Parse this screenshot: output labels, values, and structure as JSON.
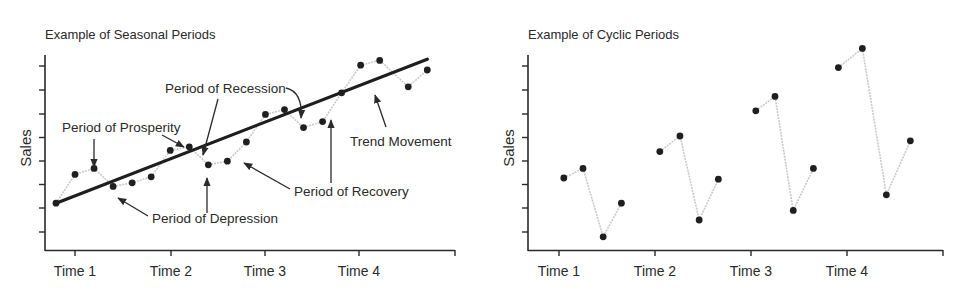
{
  "chart_data": [
    {
      "type": "line",
      "title": "Example of Seasonal Periods",
      "xlabel": "",
      "ylabel": "Sales",
      "categories": [
        "Time 1",
        "Time 2",
        "Time 3",
        "Time 4"
      ],
      "grid": false,
      "y_ticks_count": 8,
      "ylim": [
        0,
        8.5
      ],
      "xlim": [
        0,
        4.3
      ],
      "series": [
        {
          "name": "Sales",
          "x": [
            0.0,
            0.2,
            0.4,
            0.6,
            0.8,
            1.0,
            1.2,
            1.4,
            1.6,
            1.8,
            2.0,
            2.2,
            2.4,
            2.6,
            2.8,
            3.0,
            3.2,
            3.4,
            3.7,
            3.9
          ],
          "values": [
            1.95,
            3.15,
            3.4,
            2.65,
            2.8,
            3.05,
            4.15,
            4.3,
            3.55,
            3.7,
            4.5,
            5.65,
            5.85,
            5.1,
            5.35,
            6.55,
            7.7,
            7.9,
            6.8,
            7.5
          ]
        },
        {
          "name": "Trend Movement",
          "x": [
            0.0,
            3.9
          ],
          "values": [
            1.95,
            7.95
          ]
        }
      ],
      "annotations": [
        "Period of Prosperity",
        "Period of Recession",
        "Period of Depression",
        "Period of Recovery",
        "Trend Movement"
      ]
    },
    {
      "type": "line",
      "title": "Example of Cyclic Periods",
      "xlabel": "",
      "ylabel": "Sales",
      "categories": [
        "Time 1",
        "Time 2",
        "Time 3",
        "Time 4"
      ],
      "grid": false,
      "y_ticks_count": 8,
      "ylim": [
        0,
        8.5
      ],
      "xlim": [
        0,
        4.3
      ],
      "series": [
        {
          "name": "Cycle 1",
          "x": [
            0.05,
            0.25,
            0.46,
            0.65
          ],
          "values": [
            3.0,
            3.4,
            0.55,
            1.95
          ]
        },
        {
          "name": "Cycle 2",
          "x": [
            1.05,
            1.26,
            1.46,
            1.66
          ],
          "values": [
            4.1,
            4.75,
            1.25,
            2.95
          ]
        },
        {
          "name": "Cycle 3",
          "x": [
            2.05,
            2.25,
            2.44,
            2.65
          ],
          "values": [
            5.8,
            6.4,
            1.65,
            3.4
          ]
        },
        {
          "name": "Cycle 4",
          "x": [
            2.91,
            3.16,
            3.41,
            3.66
          ],
          "values": [
            7.6,
            8.4,
            2.3,
            4.55
          ]
        }
      ]
    }
  ],
  "labels": {
    "left_title": "Example of Seasonal Periods",
    "right_title": "Example of Cyclic Periods",
    "y_axis": "Sales",
    "x_ticks": [
      "Time 1",
      "Time 2",
      "Time 3",
      "Time 4"
    ],
    "annot_prosperity": "Period of Prosperity",
    "annot_recession": "Period of Recession",
    "annot_depression": "Period of Depression",
    "annot_recovery": "Period of Recovery",
    "annot_trend": "Trend Movement"
  },
  "colors": {
    "axis": "#2a2a2a",
    "series_line": "#c9c9c9",
    "trend_line": "#1e1e1e",
    "point": "#1f1f1f"
  }
}
